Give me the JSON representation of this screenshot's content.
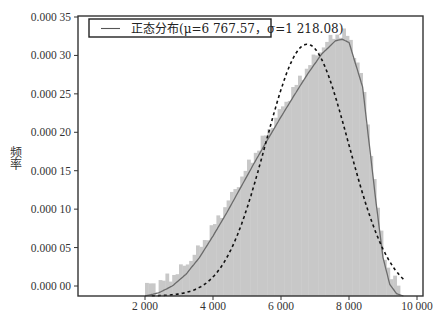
{
  "chart_data": {
    "type": "histogram",
    "title": "",
    "xlabel": "",
    "ylabel": "频率",
    "xlim": [
      -350,
      10200
    ],
    "ylim": [
      0,
      0.00035
    ],
    "grid": false,
    "legend_position": "upper left",
    "x_ticks": [
      2000,
      4000,
      6000,
      8000,
      10000
    ],
    "x_tick_labels": [
      "2 000",
      "4 000",
      "6 000",
      "8 000",
      "10 000"
    ],
    "y_ticks": [
      0,
      5e-05,
      0.0001,
      0.00015,
      0.0002,
      0.00025,
      0.0003,
      0.00035
    ],
    "y_tick_labels": [
      "0.000 00",
      "0.000 05",
      "0.000 10",
      "0.000 15",
      "0.000 20",
      "0.000 25",
      "0.000 30",
      "0.000 35"
    ],
    "legend": [
      {
        "label": "正态分布(μ=6 767.57，σ=1 218.08)",
        "style": "solid-line"
      }
    ],
    "series": [
      {
        "name": "histogram",
        "type": "bar",
        "color": "#c8c8c8",
        "x": [
          2200,
          2600,
          3000,
          3400,
          3800,
          4200,
          4600,
          5000,
          5400,
          5800,
          6200,
          6600,
          7000,
          7400,
          7800,
          8200,
          8600,
          9000,
          9400
        ],
        "values": [
          2e-06,
          8e-06,
          2e-05,
          4e-05,
          6.5e-05,
          9.5e-05,
          0.00013,
          0.000162,
          0.000195,
          0.000225,
          0.000255,
          0.000285,
          0.00031,
          0.000328,
          0.000333,
          0.00029,
          0.00018,
          4.5e-05,
          3e-06
        ]
      },
      {
        "name": "kde",
        "type": "line",
        "style": "solid",
        "color": "#666666",
        "x": [
          2000,
          2400,
          2800,
          3200,
          3600,
          4000,
          4400,
          4800,
          5200,
          5600,
          6000,
          6400,
          6800,
          7200,
          7600,
          7800,
          8000,
          8400,
          8800,
          9000,
          9200,
          9400,
          9600
        ],
        "values": [
          0.0,
          4e-06,
          1.3e-05,
          2.8e-05,
          5e-05,
          7.8e-05,
          0.000108,
          0.00014,
          0.000172,
          0.000203,
          0.000233,
          0.000262,
          0.00029,
          0.000315,
          0.000332,
          0.000334,
          0.00033,
          0.000272,
          0.00012,
          5e-05,
          1.5e-05,
          3e-06,
          0.0
        ]
      },
      {
        "name": "正态分布",
        "type": "line",
        "style": "dashed",
        "color": "#111111",
        "mu": 6767.57,
        "sigma": 1218.08,
        "x": [
          2200,
          2800,
          3400,
          4000,
          4600,
          5200,
          5800,
          6200,
          6767.57,
          7200,
          7800,
          8400,
          9000,
          9600
        ],
        "values": [
          3e-07,
          2e-06,
          1.4e-05,
          5.1e-05,
          0.00012,
          0.0002,
          0.00028,
          0.00031,
          0.000327,
          0.000309,
          0.000239,
          0.000134,
          6.1e-05,
          2.2e-05
        ]
      }
    ]
  }
}
